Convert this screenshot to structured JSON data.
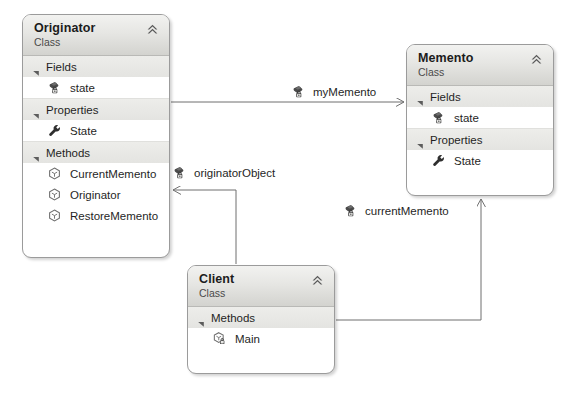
{
  "diagram": {
    "type": "uml-class-diagram",
    "pattern": "Memento",
    "background": "#ffffff",
    "line_color": "#6e6e6e"
  },
  "classes": [
    {
      "id": "originator",
      "name": "Originator",
      "stereotype": "Class",
      "collapse_icon": "chevron-double-up-icon",
      "x": 22,
      "y": 14,
      "width": 148,
      "height": 244,
      "sections": [
        {
          "id": "fields",
          "label": "Fields",
          "expander_icon": "triangle-expanded-icon",
          "members": [
            {
              "name": "state",
              "icon": "field-private-icon",
              "visibility": "private"
            }
          ]
        },
        {
          "id": "properties",
          "label": "Properties",
          "expander_icon": "triangle-expanded-icon",
          "members": [
            {
              "name": "State",
              "icon": "property-wrench-icon",
              "visibility": "public"
            }
          ]
        },
        {
          "id": "methods",
          "label": "Methods",
          "expander_icon": "triangle-expanded-icon",
          "members": [
            {
              "name": "CurrentMemento",
              "icon": "method-cube-icon",
              "visibility": "public"
            },
            {
              "name": "Originator",
              "icon": "method-cube-icon",
              "visibility": "public"
            },
            {
              "name": "RestoreMemento",
              "icon": "method-cube-icon",
              "visibility": "public"
            }
          ]
        }
      ]
    },
    {
      "id": "memento",
      "name": "Memento",
      "stereotype": "Class",
      "collapse_icon": "chevron-double-up-icon",
      "x": 406,
      "y": 44,
      "width": 148,
      "height": 152,
      "sections": [
        {
          "id": "fields",
          "label": "Fields",
          "expander_icon": "triangle-expanded-icon",
          "members": [
            {
              "name": "state",
              "icon": "field-private-icon",
              "visibility": "private"
            }
          ]
        },
        {
          "id": "properties",
          "label": "Properties",
          "expander_icon": "triangle-expanded-icon",
          "members": [
            {
              "name": "State",
              "icon": "property-wrench-icon",
              "visibility": "public"
            }
          ]
        }
      ]
    },
    {
      "id": "client",
      "name": "Client",
      "stereotype": "Class",
      "collapse_icon": "chevron-double-up-icon",
      "x": 187,
      "y": 265,
      "width": 148,
      "height": 109,
      "sections": [
        {
          "id": "methods",
          "label": "Methods",
          "expander_icon": "triangle-expanded-icon",
          "members": [
            {
              "name": "Main",
              "icon": "method-private-cube-icon",
              "visibility": "private"
            }
          ]
        }
      ]
    }
  ],
  "associations": [
    {
      "id": "my-memento",
      "label": "myMemento",
      "icon": "field-private-icon",
      "from": "originator",
      "to": "memento",
      "label_x": 291,
      "label_y": 84
    },
    {
      "id": "originator-object",
      "label": "originatorObject",
      "icon": "field-private-icon",
      "from": "client",
      "to": "originator",
      "label_x": 172,
      "label_y": 165
    },
    {
      "id": "current-memento",
      "label": "currentMemento",
      "icon": "field-private-icon",
      "from": "client",
      "to": "memento",
      "label_x": 343,
      "label_y": 203
    }
  ]
}
